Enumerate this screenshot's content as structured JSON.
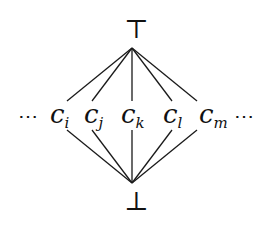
{
  "diagram": {
    "type": "hasse-diagram",
    "top": {
      "symbol": "⊤",
      "name": "top"
    },
    "bottom": {
      "symbol": "⊥",
      "name": "bottom"
    },
    "left_ellipsis": "⋯",
    "right_ellipsis": "⋯",
    "nodes": [
      {
        "base": "c",
        "sub": "i"
      },
      {
        "base": "c",
        "sub": "j"
      },
      {
        "base": "c",
        "sub": "k"
      },
      {
        "base": "c",
        "sub": "l"
      },
      {
        "base": "c",
        "sub": "m"
      }
    ],
    "edges": [
      {
        "from": "top",
        "to": "c_i"
      },
      {
        "from": "top",
        "to": "c_j"
      },
      {
        "from": "top",
        "to": "c_k"
      },
      {
        "from": "top",
        "to": "c_l"
      },
      {
        "from": "top",
        "to": "c_m"
      },
      {
        "from": "c_i",
        "to": "bottom"
      },
      {
        "from": "c_j",
        "to": "bottom"
      },
      {
        "from": "c_k",
        "to": "bottom"
      },
      {
        "from": "c_l",
        "to": "bottom"
      },
      {
        "from": "c_m",
        "to": "bottom"
      }
    ],
    "colors": {
      "stroke": "#1a1a1a",
      "background": "#ffffff"
    }
  }
}
